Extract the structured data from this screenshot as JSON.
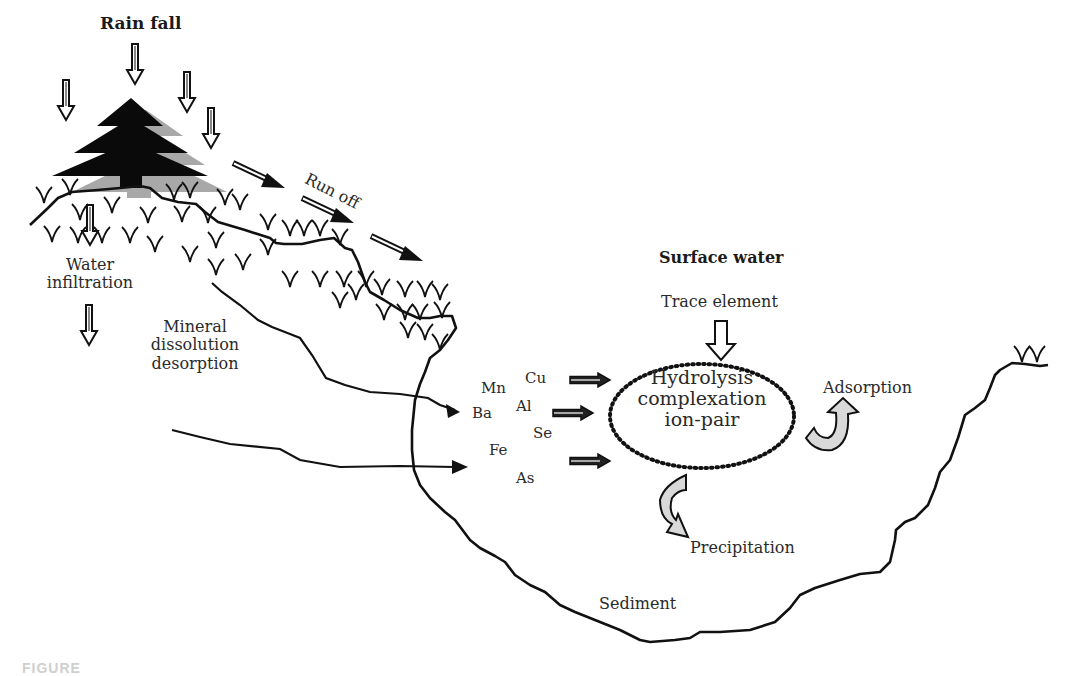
{
  "figure": {
    "caption_fragment": "FIGURE",
    "colors": {
      "ink": "#111111",
      "tree": "#0a0a0a",
      "tree_shadow": "#a8a8a8",
      "curved_arrow_fill": "#d9d9d9",
      "background": "#ffffff"
    }
  },
  "labels": {
    "rain_fall": "Rain fall",
    "run_off": "Run off",
    "water_infiltration_line1": "Water",
    "water_infiltration_line2": "infiltration",
    "mineral_line1": "Mineral",
    "mineral_line2": "dissolution",
    "mineral_line3": "desorption",
    "surface_water": "Surface water",
    "trace_element": "Trace element",
    "process_line1": "Hydrolysis",
    "process_line2": "complexation",
    "process_line3": "ion-pair",
    "adsorption": "Adsorption",
    "precipitation": "Precipitation",
    "sediment": "Sediment"
  },
  "elements": [
    {
      "symbol": "Mn"
    },
    {
      "symbol": "Cu"
    },
    {
      "symbol": "Ba"
    },
    {
      "symbol": "Al"
    },
    {
      "symbol": "Se"
    },
    {
      "symbol": "Fe"
    },
    {
      "symbol": "As"
    }
  ],
  "icons": {
    "tree": "conifer-tree-icon",
    "rain_arrow": "hollow-down-arrow",
    "runoff_arrow": "diagonal-arrow",
    "grass": "grass-tuft-icon",
    "curved_arrow": "curved-arrow-icon"
  }
}
